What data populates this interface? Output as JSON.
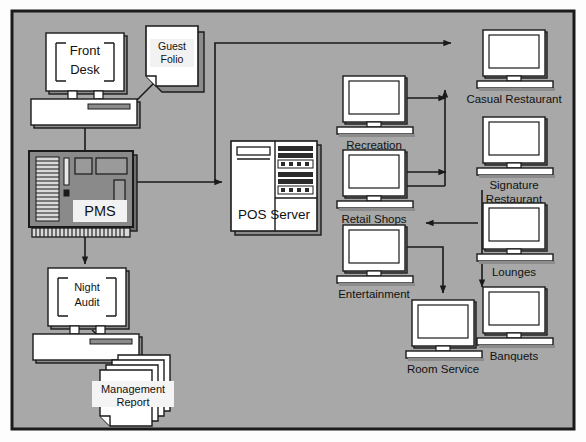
{
  "diagram": {
    "canvas": {
      "width": 586,
      "height": 442
    },
    "colors": {
      "background": "#a8a8a8",
      "frame_border": "#1a1a1a",
      "node_fill": "#ffffff",
      "node_border": "#1a1a1a",
      "device_shade": "#8c8c8c",
      "device_dark": "#2b2b2b",
      "label_text": "#111111",
      "page_background": "#fdfdfd"
    },
    "nodes": [
      {
        "id": "front-desk",
        "label": "Front Desk",
        "type": "desktop-computer",
        "label_position": "inside-screen"
      },
      {
        "id": "guest-folio",
        "label": "Guest Folio",
        "type": "document",
        "label_position": "inside"
      },
      {
        "id": "pms",
        "label": "PMS",
        "type": "mainframe",
        "label_position": "inside"
      },
      {
        "id": "night-audit",
        "label": "Night Audit",
        "type": "desktop-computer",
        "label_position": "inside-screen"
      },
      {
        "id": "management-report",
        "label": "Management Report",
        "type": "document-stack",
        "label_position": "inside"
      },
      {
        "id": "pos-server",
        "label": "POS Server",
        "type": "tower-server",
        "label_position": "inside"
      },
      {
        "id": "recreation",
        "label": "Recreation",
        "type": "terminal",
        "label_position": "below"
      },
      {
        "id": "retail-shops",
        "label": "Retail Shops",
        "type": "terminal",
        "label_position": "below"
      },
      {
        "id": "entertainment",
        "label": "Entertainment",
        "type": "terminal",
        "label_position": "below"
      },
      {
        "id": "room-service",
        "label": "Room Service",
        "type": "terminal",
        "label_position": "below"
      },
      {
        "id": "casual-restaurant",
        "label": "Casual Restaurant",
        "type": "terminal",
        "label_position": "below"
      },
      {
        "id": "signature-restaurant",
        "label": "Signature Restaurant",
        "type": "terminal",
        "label_position": "below",
        "label_lines": [
          "Signature",
          "Restaurant"
        ]
      },
      {
        "id": "lounges",
        "label": "Lounges",
        "type": "terminal",
        "label_position": "below"
      },
      {
        "id": "banquets",
        "label": "Banquets",
        "type": "terminal",
        "label_position": "below"
      }
    ],
    "connections": [
      {
        "id": "pms-to-front-desk",
        "from": "pms",
        "to": "front-desk",
        "arrow": "single"
      },
      {
        "id": "front-desk-to-guest-folio",
        "from": "front-desk",
        "to": "guest-folio",
        "arrow": "single"
      },
      {
        "id": "pms-to-night-audit",
        "from": "pms",
        "to": "night-audit",
        "arrow": "single"
      },
      {
        "id": "night-audit-to-report",
        "from": "night-audit",
        "to": "management-report",
        "arrow": "single"
      },
      {
        "id": "pms-to-pos-server",
        "from": "pms",
        "to": "pos-server",
        "arrow": "double"
      },
      {
        "id": "pos-to-casual-restaurant",
        "from": "pos-server",
        "to": "casual-restaurant",
        "arrow": "single"
      },
      {
        "id": "recreation-to-trunk",
        "from": "recreation",
        "to": "trunk",
        "arrow": "single"
      },
      {
        "id": "retail-shops-to-trunk",
        "from": "retail-shops",
        "to": "trunk",
        "arrow": "single"
      },
      {
        "id": "entertainment-to-room-service",
        "from": "entertainment",
        "to": "room-service",
        "arrow": "single"
      },
      {
        "id": "lounges-to-trunk",
        "from": "lounges",
        "to": "trunk",
        "arrow": "single"
      },
      {
        "id": "lounges-to-banquets",
        "from": "lounges",
        "to": "banquets",
        "arrow": "single"
      },
      {
        "id": "trunk-to-signature",
        "from": "trunk",
        "to": "signature-restaurant",
        "arrow": "single"
      }
    ]
  }
}
